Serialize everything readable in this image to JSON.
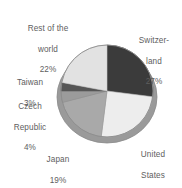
{
  "chart_data": {
    "type": "pie",
    "title": "",
    "subtitle": "",
    "xlabel": "",
    "ylabel": "",
    "grid": false,
    "legend_position": "none",
    "label_format": "name + percent",
    "start_angle_deg": 0,
    "direction": "clockwise",
    "categories": [
      "Switzerland",
      "United States",
      "Japan",
      "Czech Republic",
      "Taiwan",
      "Rest of the world"
    ],
    "values": [
      27,
      25,
      19,
      4,
      3,
      22
    ],
    "units": "percent",
    "total": 100,
    "slices": [
      {
        "name": "Switzerland",
        "label_line1": "Switzer-",
        "label_line2": "land",
        "value": 27,
        "value_text": "27%",
        "color": "#3b3b3b",
        "start_deg": 0,
        "end_deg": 97.2
      },
      {
        "name": "United States",
        "label_line1": "United",
        "label_line2": "States",
        "value": 25,
        "value_text": "25%",
        "color": "#ededed",
        "start_deg": 97.2,
        "end_deg": 187.2
      },
      {
        "name": "Japan",
        "label_line1": "Japan",
        "label_line2": "",
        "value": 19,
        "value_text": "19%",
        "color": "#a9a9a9",
        "start_deg": 187.2,
        "end_deg": 255.6
      },
      {
        "name": "Czech Republic",
        "label_line1": "Czech",
        "label_line2": "Republic",
        "value": 4,
        "value_text": "4%",
        "color": "#9b9b9b",
        "start_deg": 255.6,
        "end_deg": 270.0
      },
      {
        "name": "Taiwan",
        "label_line1": "Taiwan",
        "label_line2": "",
        "value": 3,
        "value_text": "3%",
        "color": "#565656",
        "start_deg": 270.0,
        "end_deg": 280.8
      },
      {
        "name": "Rest of the world",
        "label_line1": "Rest of the",
        "label_line2": "world",
        "value": 22,
        "value_text": "22%",
        "color": "#e2e2e2",
        "start_deg": 280.8,
        "end_deg": 360.0
      }
    ],
    "geometry": {
      "center_x": 107,
      "center_y": 91,
      "radius": 50,
      "depth": 6
    },
    "colors": {
      "background": "#ffffff",
      "label_text": "#5e5e5e",
      "outline": "#8c8c8c",
      "shadow": "#9a9a9a"
    }
  },
  "labels": {
    "rest_of_world": {
      "line1": "Rest of the",
      "line2": "world",
      "percent": "22%"
    },
    "switzerland": {
      "line1": "Switzer-",
      "line2": "land",
      "percent": "27%"
    },
    "taiwan": {
      "line1": "Taiwan",
      "percent": "3%"
    },
    "czech_republic": {
      "line1": "Czech",
      "line2": "Republic",
      "percent": "4%"
    },
    "japan": {
      "line1": "Japan",
      "percent": "19%"
    },
    "united_states": {
      "line1": "United",
      "line2": "States",
      "percent": "25%"
    }
  }
}
